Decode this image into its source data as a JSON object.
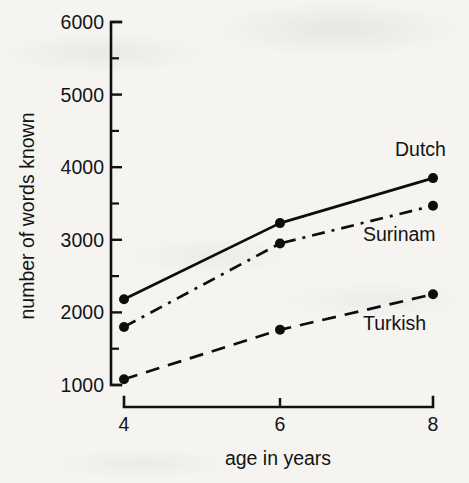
{
  "chart_data": {
    "type": "line",
    "title": "",
    "subtitle": "",
    "xlabel": "age in years",
    "ylabel": "number of words known",
    "x": [
      4,
      6,
      8
    ],
    "categories": [
      "4",
      "6",
      "8"
    ],
    "xtick_labels": [
      "4",
      "6",
      "8"
    ],
    "ytick_labels": [
      "1000",
      "2000",
      "3000",
      "4000",
      "5000",
      "6000"
    ],
    "ytick_values": [
      1000,
      2000,
      3000,
      4000,
      5000,
      6000
    ],
    "yminor_values": [
      1500,
      2500,
      3500,
      4500,
      5500
    ],
    "ylim": [
      1000,
      6000
    ],
    "xlim": [
      4,
      8
    ],
    "grid": false,
    "legend_position": "inline-right-of-line-ends",
    "series": [
      {
        "name": "Dutch",
        "label": "Dutch",
        "linestyle": "solid",
        "marker": "filled-circle",
        "color": "#0d0d0d",
        "values": [
          2180,
          3230,
          3850
        ]
      },
      {
        "name": "Surinam",
        "label": "Surinam",
        "linestyle": "dash-dot",
        "marker": "filled-circle",
        "color": "#0d0d0d",
        "values": [
          1800,
          2950,
          3470
        ]
      },
      {
        "name": "Turkish",
        "label": "Turkish",
        "linestyle": "dashed",
        "marker": "filled-circle",
        "color": "#0d0d0d",
        "values": [
          1080,
          1760,
          2250
        ]
      }
    ],
    "annotations": []
  },
  "figure": {
    "background_color": "#f5f4f1",
    "ink_color": "#0d0d0d"
  }
}
